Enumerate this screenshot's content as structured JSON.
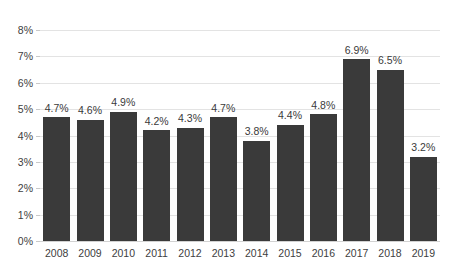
{
  "chart_data": {
    "type": "bar",
    "title": "",
    "subtitle": "",
    "xlabel": "",
    "ylabel": "",
    "categories": [
      "2008",
      "2009",
      "2010",
      "2011",
      "2012",
      "2013",
      "2014",
      "2015",
      "2016",
      "2017",
      "2018",
      "2019"
    ],
    "values": [
      4.7,
      4.6,
      4.9,
      4.2,
      4.3,
      4.7,
      3.8,
      4.4,
      4.8,
      6.9,
      6.5,
      3.2
    ],
    "data_labels": [
      "4.7%",
      "4.6%",
      "4.9%",
      "4.2%",
      "4.3%",
      "4.7%",
      "3.8%",
      "4.4%",
      "4.8%",
      "6.9%",
      "6.5%",
      "3.2%"
    ],
    "ylim": [
      0,
      8
    ],
    "ytick_values": [
      0,
      1,
      2,
      3,
      4,
      5,
      6,
      7,
      8
    ],
    "ytick_labels": [
      "0%",
      "1%",
      "2%",
      "3%",
      "4%",
      "5%",
      "6%",
      "7%",
      "8%"
    ],
    "grid": "horizontal",
    "legend": "none",
    "series_color": "#3a3a3a",
    "gridline_color": "#e3e3e3",
    "annotations": []
  }
}
